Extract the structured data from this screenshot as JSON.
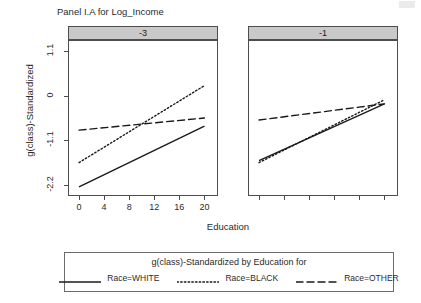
{
  "chart_data": {
    "type": "line",
    "title": "Panel I.A for Log_Income",
    "xlabel": "Education",
    "ylabel": "g(class)-Standardized",
    "xlim": [
      -1.6,
      22
    ],
    "ylim": [
      -2.45,
      1.35
    ],
    "xticks": [
      "0",
      "4",
      "8",
      "12",
      "16",
      "20"
    ],
    "xtick_values": [
      0,
      4,
      8,
      12,
      16,
      20
    ],
    "yticks": [
      "1.1",
      "0",
      "-1.1",
      "-2.2"
    ],
    "ytick_values": [
      1.1,
      0,
      -1.1,
      -2.2
    ],
    "grid": false,
    "legend_position": "bottom",
    "legend_title": "g(class)-Standardized by Education for",
    "panel_variable": "Log_Income",
    "panels": [
      {
        "strip_label": "-3",
        "series": [
          {
            "name": "Race=WHITE",
            "style": "solid",
            "x": [
              0,
              20
            ],
            "values": [
              -2.25,
              -0.75
            ]
          },
          {
            "name": "Race=BLACK",
            "style": "dotted",
            "x": [
              0,
              20
            ],
            "values": [
              -1.65,
              0.25
            ]
          },
          {
            "name": "Race=OTHER",
            "style": "dashed",
            "x": [
              0,
              20
            ],
            "values": [
              -0.85,
              -0.55
            ]
          }
        ]
      },
      {
        "strip_label": "-1",
        "series": [
          {
            "name": "Race=WHITE",
            "style": "solid",
            "x": [
              0,
              20
            ],
            "values": [
              -1.6,
              -0.2
            ]
          },
          {
            "name": "Race=BLACK",
            "style": "dotted",
            "x": [
              0,
              20
            ],
            "values": [
              -1.65,
              -0.1
            ]
          },
          {
            "name": "Race=OTHER",
            "style": "dashed",
            "x": [
              0,
              20
            ],
            "values": [
              -0.6,
              -0.2
            ]
          }
        ]
      }
    ],
    "legend": [
      {
        "label": "Race=WHITE",
        "style": "solid"
      },
      {
        "label": "Race=BLACK",
        "style": "dotted"
      },
      {
        "label": "Race=OTHER",
        "style": "dashed"
      }
    ],
    "colors": {
      "line": "#1a1a1a",
      "strip_background": "#c9c9c9",
      "border": "#4d4d4d",
      "text": "#2b2b2b"
    }
  }
}
